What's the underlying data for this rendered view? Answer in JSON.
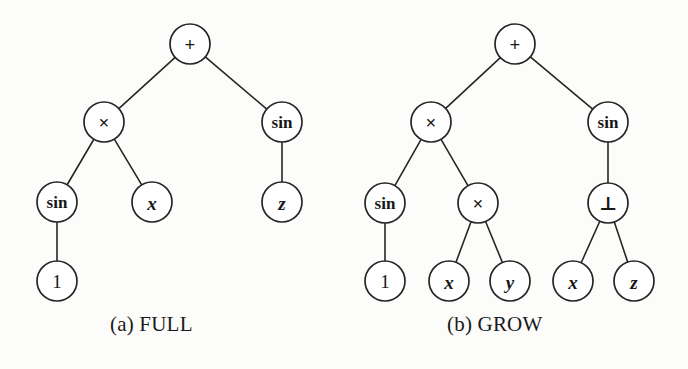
{
  "figure": {
    "width": 688,
    "height": 369,
    "background_color": "#fcfcfb",
    "ink_color": "#262626",
    "node_radius": 20
  },
  "panels": [
    {
      "id": "full",
      "caption": "(a) FULL",
      "nodes": [
        {
          "id": "a-root",
          "label": "+",
          "kind": "op",
          "x": 190,
          "y": 44
        },
        {
          "id": "a-mul",
          "label": "×",
          "kind": "op",
          "x": 104,
          "y": 122
        },
        {
          "id": "a-sin1",
          "label": "sin",
          "kind": "func",
          "x": 282,
          "y": 122
        },
        {
          "id": "a-sin2",
          "label": "sin",
          "kind": "func",
          "x": 57,
          "y": 202
        },
        {
          "id": "a-x",
          "label": "x",
          "kind": "var",
          "x": 152,
          "y": 202
        },
        {
          "id": "a-z",
          "label": "z",
          "kind": "var",
          "x": 282,
          "y": 202
        },
        {
          "id": "a-one",
          "label": "1",
          "kind": "const",
          "x": 57,
          "y": 281
        }
      ],
      "edges": [
        {
          "from": "a-root",
          "to": "a-mul"
        },
        {
          "from": "a-root",
          "to": "a-sin1"
        },
        {
          "from": "a-mul",
          "to": "a-sin2"
        },
        {
          "from": "a-mul",
          "to": "a-x"
        },
        {
          "from": "a-sin1",
          "to": "a-z"
        },
        {
          "from": "a-sin2",
          "to": "a-one"
        }
      ]
    },
    {
      "id": "grow",
      "caption": "(b) GROW",
      "nodes": [
        {
          "id": "b-root",
          "label": "+",
          "kind": "op",
          "x": 515,
          "y": 44
        },
        {
          "id": "b-mul1",
          "label": "×",
          "kind": "op",
          "x": 431,
          "y": 122
        },
        {
          "id": "b-sin1",
          "label": "sin",
          "kind": "func",
          "x": 608,
          "y": 122
        },
        {
          "id": "b-sin2",
          "label": "sin",
          "kind": "func",
          "x": 385,
          "y": 203
        },
        {
          "id": "b-mul2",
          "label": "×",
          "kind": "op",
          "x": 478,
          "y": 203
        },
        {
          "id": "b-bot",
          "label": "⊥",
          "kind": "op",
          "x": 608,
          "y": 203
        },
        {
          "id": "b-one",
          "label": "1",
          "kind": "const",
          "x": 385,
          "y": 281
        },
        {
          "id": "b-x1",
          "label": "x",
          "kind": "var",
          "x": 449,
          "y": 281
        },
        {
          "id": "b-y",
          "label": "y",
          "kind": "var",
          "x": 510,
          "y": 281
        },
        {
          "id": "b-x2",
          "label": "x",
          "kind": "var",
          "x": 573,
          "y": 281
        },
        {
          "id": "b-z",
          "label": "z",
          "kind": "var",
          "x": 634,
          "y": 281
        }
      ],
      "edges": [
        {
          "from": "b-root",
          "to": "b-mul1"
        },
        {
          "from": "b-root",
          "to": "b-sin1"
        },
        {
          "from": "b-mul1",
          "to": "b-sin2"
        },
        {
          "from": "b-mul1",
          "to": "b-mul2"
        },
        {
          "from": "b-sin1",
          "to": "b-bot"
        },
        {
          "from": "b-sin2",
          "to": "b-one"
        },
        {
          "from": "b-mul2",
          "to": "b-x1"
        },
        {
          "from": "b-mul2",
          "to": "b-y"
        },
        {
          "from": "b-bot",
          "to": "b-x2"
        },
        {
          "from": "b-bot",
          "to": "b-z"
        }
      ]
    }
  ]
}
